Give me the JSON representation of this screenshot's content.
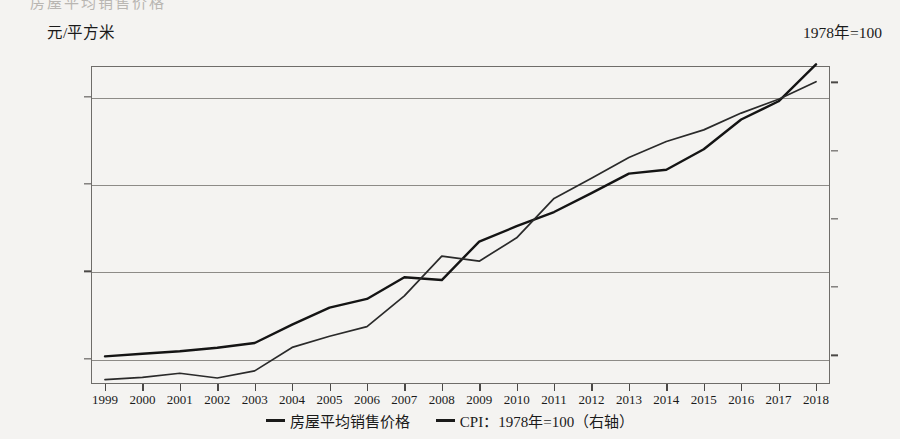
{
  "page": {
    "bleed_text_top": "房屋平均销售价格"
  },
  "axis_titles": {
    "left": "元/平方米",
    "right": "1978年=100"
  },
  "legend": [
    {
      "label": "房屋平均销售价格",
      "marker": "line-solid-thick",
      "color": "#141414"
    },
    {
      "label": "CPI：1978年=100（右轴）",
      "marker": "line-solid-thin",
      "color": "#2a2a2a"
    }
  ],
  "chart_data": {
    "type": "line",
    "title": "",
    "xlabel": "",
    "ylabel": "元/平方米",
    "y2label": "1978年=100",
    "grid": true,
    "legend_position": "bottom-center",
    "categories": [
      "1999",
      "2000",
      "2001",
      "2002",
      "2003",
      "2004",
      "2005",
      "2006",
      "2007",
      "2008",
      "2009",
      "2010",
      "2011",
      "2012",
      "2013",
      "2014",
      "2015",
      "2016",
      "2017",
      "2018"
    ],
    "ylim": [
      1420,
      8700
    ],
    "yticks": [
      "2 000.00",
      "4 000.00",
      "6 000.00",
      "8 000.00"
    ],
    "ytick_values": [
      2000,
      4000,
      6000,
      8000
    ],
    "y2lim": [
      429,
      662
    ],
    "y2ticks": [
      "450.00",
      "500.00",
      "550.00",
      "600.00",
      "650.00"
    ],
    "y2tick_values": [
      450,
      500,
      550,
      600,
      650
    ],
    "series": [
      {
        "name": "房屋平均销售价格",
        "axis": "left",
        "units": "元/平方米",
        "values": [
          2053,
          2112,
          2170,
          2250,
          2359,
          2778,
          3168,
          3367,
          3864,
          3800,
          4681,
          5032,
          5357,
          5791,
          6237,
          6324,
          6793,
          7476,
          7892,
          8737
        ]
      },
      {
        "name": "CPI：1978年=100（右轴）",
        "axis": "right",
        "units": "1978年=100",
        "values": [
          432.2,
          433.9,
          436.9,
          433.4,
          438.6,
          455.8,
          464.0,
          471.0,
          493.6,
          522.7,
          519.0,
          536.1,
          565.0,
          579.7,
          595.0,
          606.7,
          615.2,
          627.5,
          637.6,
          650.5
        ]
      }
    ]
  }
}
